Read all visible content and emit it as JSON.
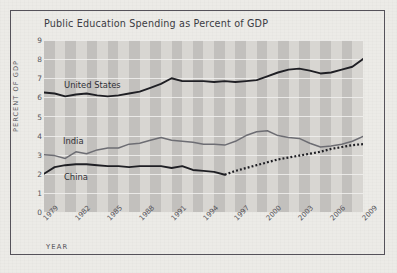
{
  "chart_data": {
    "type": "line",
    "title": "Public Education Spending as Percent of GDP",
    "xlabel": "YEAR",
    "ylabel": "PERCENT OF GDP",
    "ylim": [
      0,
      9
    ],
    "xlim": [
      1979,
      2009
    ],
    "grid": true,
    "legend_position": "inline-labels",
    "y_ticks": [
      "9",
      "8",
      "7",
      "6",
      "5",
      "4",
      "3",
      "2",
      "1",
      "0"
    ],
    "x_ticks": [
      "1979",
      "1982",
      "1985",
      "1988",
      "1991",
      "1994",
      "1997",
      "2000",
      "2003",
      "2006",
      "2009"
    ],
    "x": [
      1979,
      1980,
      1981,
      1982,
      1983,
      1984,
      1985,
      1986,
      1987,
      1988,
      1989,
      1990,
      1991,
      1992,
      1993,
      1994,
      1995,
      1996,
      1997,
      1998,
      1999,
      2000,
      2001,
      2002,
      2003,
      2004,
      2005,
      2006,
      2007,
      2008,
      2009
    ],
    "series": [
      {
        "name": "United States",
        "color": "#1f1f24",
        "style": "solid",
        "values": [
          6.25,
          6.2,
          6.05,
          6.15,
          6.2,
          6.1,
          6.05,
          6.1,
          6.2,
          6.3,
          6.5,
          6.7,
          7.0,
          6.85,
          6.85,
          6.85,
          6.8,
          6.85,
          6.8,
          6.85,
          6.9,
          7.1,
          7.3,
          7.45,
          7.5,
          7.4,
          7.25,
          7.3,
          7.45,
          7.6,
          8.0
        ]
      },
      {
        "name": "India",
        "color": "#6d6d73",
        "style": "solid",
        "values": [
          3.0,
          2.95,
          2.8,
          3.15,
          3.05,
          3.25,
          3.35,
          3.35,
          3.55,
          3.6,
          3.75,
          3.9,
          3.75,
          3.7,
          3.65,
          3.55,
          3.55,
          3.5,
          3.7,
          4.0,
          4.2,
          4.25,
          4.0,
          3.9,
          3.85,
          3.6,
          3.4,
          3.45,
          3.55,
          3.7,
          3.95
        ]
      },
      {
        "name": "China",
        "color": "#1f1f24",
        "style": "solid-then-dotted",
        "dotted_from": 1996,
        "values": [
          2.0,
          2.35,
          2.45,
          2.5,
          2.5,
          2.45,
          2.4,
          2.4,
          2.35,
          2.4,
          2.4,
          2.4,
          2.3,
          2.4,
          2.2,
          2.15,
          2.1,
          1.95,
          2.15,
          2.3,
          2.45,
          2.6,
          2.75,
          2.85,
          2.95,
          3.05,
          3.15,
          3.3,
          3.4,
          3.5,
          3.55
        ]
      }
    ],
    "annotations": [
      {
        "name": "united-states-label",
        "text": "United States"
      },
      {
        "name": "india-label",
        "text": "India"
      },
      {
        "name": "china-label",
        "text": "China"
      }
    ],
    "colors": {
      "plot_background": "#d8d6d2",
      "band": "#c2c0bd",
      "gridline": "#f1f0ee",
      "frame": "#55525a",
      "paper": "#ecebe7"
    }
  }
}
